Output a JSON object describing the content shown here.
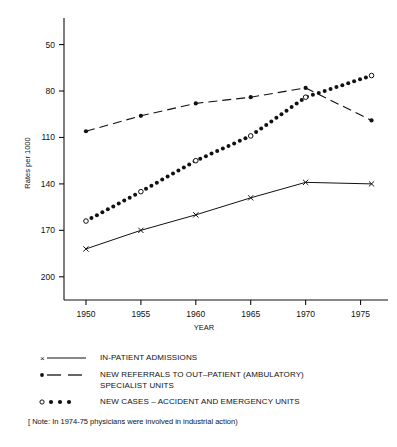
{
  "chart_data": {
    "type": "line",
    "title": "",
    "xlabel": "YEAR",
    "ylabel": "Rates per 1000",
    "xlim": [
      1948,
      1977.5
    ],
    "ylim": [
      35,
      212
    ],
    "xticks": [
      1950,
      1955,
      1960,
      1965,
      1970,
      1975
    ],
    "yticks": [
      50,
      80,
      110,
      140,
      170,
      200
    ],
    "grid": false,
    "legend_position": "below",
    "series": [
      {
        "name": "IN-PATIENT ADMISSIONS",
        "marker": "x",
        "linestyle": "solid",
        "x": [
          1950,
          1955,
          1960,
          1965,
          1970,
          1976
        ],
        "values": [
          68,
          80,
          90,
          101,
          111,
          110
        ]
      },
      {
        "name": "NEW REFERRALS TO OUT-PATIENT (AMBULATORY) SPECIALIST UNITS",
        "marker": "filled-circle",
        "linestyle": "dashed",
        "x": [
          1950,
          1955,
          1960,
          1965,
          1970,
          1976
        ],
        "values": [
          144,
          154,
          162,
          166,
          172,
          151
        ]
      },
      {
        "name": "NEW CASES -- ACCIDENT AND EMERGENCY UNITS",
        "marker": "dotted-with-open-circles",
        "linestyle": "dotted",
        "x": [
          1950,
          1955,
          1960,
          1965,
          1970,
          1976
        ],
        "values": [
          86,
          105,
          125,
          141,
          166,
          180
        ],
        "open_circle_years": [
          1950,
          1955,
          1960,
          1965,
          1970,
          1976
        ]
      }
    ]
  },
  "axis": {
    "y_title": "Rates per 1000",
    "x_title": "YEAR",
    "y_tick_labels": [
      "200",
      "170",
      "140",
      "110",
      "80",
      "50"
    ],
    "x_tick_labels": [
      "1950",
      "1955",
      "1960",
      "1965",
      "1970",
      "1975"
    ]
  },
  "legend": {
    "items": [
      {
        "key": "x-solid-line",
        "label": "IN-PATIENT ADMISSIONS",
        "label2": ""
      },
      {
        "key": "dot-dashed-line",
        "label": "NEW REFERRALS TO OUT–PATIENT (AMBULATORY)",
        "label2": "SPECIALIST UNITS"
      },
      {
        "key": "open-dot-dotted-line",
        "label": "NEW CASES – ACCIDENT AND EMERGENCY UNITS",
        "label2": ""
      }
    ],
    "note": "[ Note: In 1974-75 physicians were involved in industrial action)"
  }
}
